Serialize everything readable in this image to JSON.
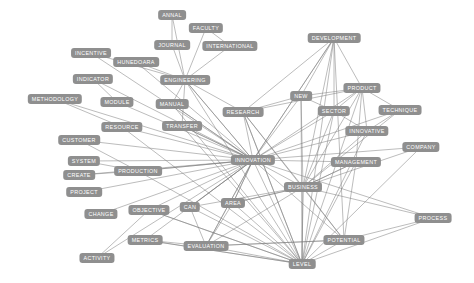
{
  "figure": {
    "type": "network-graph",
    "background_color": "#ffffff",
    "node_fill_color": "#8f8f8f",
    "node_text_color": "#ffffff",
    "edge_color": "#7a7a7a",
    "width": 474,
    "height": 283
  },
  "chart_data": {
    "type": "network",
    "title": "",
    "xlabel": "",
    "ylabel": "",
    "grid": false,
    "legend": "none",
    "node_count": 37,
    "edge_count": 121,
    "nodes": [
      {
        "id": "annal",
        "label": "ANNAL",
        "x": 172,
        "y": 15
      },
      {
        "id": "faculty",
        "label": "FACULTY",
        "x": 206,
        "y": 28
      },
      {
        "id": "journal",
        "label": "JOURNAL",
        "x": 172,
        "y": 45
      },
      {
        "id": "international",
        "label": "INTERNATIONAL",
        "x": 230,
        "y": 46
      },
      {
        "id": "development",
        "label": "DEVELOPMENT",
        "x": 334,
        "y": 38
      },
      {
        "id": "incentive",
        "label": "INCENTIVE",
        "x": 91,
        "y": 53
      },
      {
        "id": "hunedoara",
        "label": "HUNEDOARA",
        "x": 136,
        "y": 62
      },
      {
        "id": "indicator",
        "label": "INDICATOR",
        "x": 93,
        "y": 79
      },
      {
        "id": "engineering",
        "label": "ENGINEERING",
        "x": 185,
        "y": 80
      },
      {
        "id": "product",
        "label": "PRODUCT",
        "x": 362,
        "y": 88
      },
      {
        "id": "new",
        "label": "NEW",
        "x": 301,
        "y": 96
      },
      {
        "id": "methodology",
        "label": "METHODOLOGY",
        "x": 55,
        "y": 99
      },
      {
        "id": "module",
        "label": "MODULE",
        "x": 117,
        "y": 102
      },
      {
        "id": "manual",
        "label": "MANUAL",
        "x": 172,
        "y": 104
      },
      {
        "id": "research",
        "label": "RESEARCH",
        "x": 243,
        "y": 112
      },
      {
        "id": "sector",
        "label": "SECTOR",
        "x": 334,
        "y": 111
      },
      {
        "id": "technique",
        "label": "TECHNIQUE",
        "x": 400,
        "y": 110
      },
      {
        "id": "resource",
        "label": "RESOURCE",
        "x": 122,
        "y": 127
      },
      {
        "id": "transfer",
        "label": "TRANSFER",
        "x": 182,
        "y": 126
      },
      {
        "id": "innovative",
        "label": "INNOVATIVE",
        "x": 367,
        "y": 131
      },
      {
        "id": "customer",
        "label": "CUSTOMER",
        "x": 79,
        "y": 140
      },
      {
        "id": "company",
        "label": "COMPANY",
        "x": 421,
        "y": 147
      },
      {
        "id": "system",
        "label": "SYSTEM",
        "x": 84,
        "y": 161
      },
      {
        "id": "innovation",
        "label": "INNOVATION",
        "x": 253,
        "y": 160
      },
      {
        "id": "management",
        "label": "MANAGEMENT",
        "x": 356,
        "y": 162
      },
      {
        "id": "production",
        "label": "PRODUCTION",
        "x": 138,
        "y": 171
      },
      {
        "id": "create",
        "label": "CREATE",
        "x": 79,
        "y": 175
      },
      {
        "id": "business",
        "label": "BUSINESS",
        "x": 303,
        "y": 187
      },
      {
        "id": "project",
        "label": "PROJECT",
        "x": 84,
        "y": 192
      },
      {
        "id": "objective",
        "label": "OBJECTIVE",
        "x": 149,
        "y": 210
      },
      {
        "id": "can",
        "label": "CAN",
        "x": 190,
        "y": 207
      },
      {
        "id": "area",
        "label": "AREA",
        "x": 233,
        "y": 203
      },
      {
        "id": "change",
        "label": "CHANGE",
        "x": 101,
        "y": 214
      },
      {
        "id": "process",
        "label": "PROCESS",
        "x": 433,
        "y": 218
      },
      {
        "id": "metrics",
        "label": "METRICS",
        "x": 145,
        "y": 240
      },
      {
        "id": "potential",
        "label": "POTENTIAL",
        "x": 344,
        "y": 240
      },
      {
        "id": "evaluation",
        "label": "EVALUATION",
        "x": 206,
        "y": 246
      },
      {
        "id": "activity",
        "label": "ACTIVITY",
        "x": 97,
        "y": 258
      },
      {
        "id": "level",
        "label": "LEVEL",
        "x": 302,
        "y": 264
      }
    ],
    "edges": [
      [
        "annal",
        "engineering"
      ],
      [
        "faculty",
        "engineering"
      ],
      [
        "journal",
        "engineering"
      ],
      [
        "international",
        "engineering"
      ],
      [
        "faculty",
        "international"
      ],
      [
        "journal",
        "annal"
      ],
      [
        "hunedoara",
        "engineering"
      ],
      [
        "incentive",
        "innovation"
      ],
      [
        "indicator",
        "innovation"
      ],
      [
        "indicator",
        "module"
      ],
      [
        "methodology",
        "innovation"
      ],
      [
        "methodology",
        "resource"
      ],
      [
        "module",
        "innovation"
      ],
      [
        "manual",
        "innovation"
      ],
      [
        "manual",
        "engineering"
      ],
      [
        "engineering",
        "innovation"
      ],
      [
        "engineering",
        "transfer"
      ],
      [
        "engineering",
        "research"
      ],
      [
        "resource",
        "innovation"
      ],
      [
        "transfer",
        "innovation"
      ],
      [
        "customer",
        "innovation"
      ],
      [
        "system",
        "innovation"
      ],
      [
        "create",
        "innovation"
      ],
      [
        "project",
        "innovation"
      ],
      [
        "change",
        "innovation"
      ],
      [
        "production",
        "innovation"
      ],
      [
        "objective",
        "innovation"
      ],
      [
        "can",
        "innovation"
      ],
      [
        "area",
        "innovation"
      ],
      [
        "metrics",
        "innovation"
      ],
      [
        "evaluation",
        "innovation"
      ],
      [
        "activity",
        "innovation"
      ],
      [
        "activity",
        "objective"
      ],
      [
        "research",
        "innovation"
      ],
      [
        "innovation",
        "business"
      ],
      [
        "innovation",
        "level"
      ],
      [
        "innovation",
        "potential"
      ],
      [
        "innovation",
        "development"
      ],
      [
        "innovation",
        "new"
      ],
      [
        "innovation",
        "product"
      ],
      [
        "innovation",
        "sector"
      ],
      [
        "innovation",
        "management"
      ],
      [
        "innovation",
        "innovative"
      ],
      [
        "innovation",
        "technique"
      ],
      [
        "innovation",
        "process"
      ],
      [
        "innovation",
        "company"
      ],
      [
        "innovation",
        "evaluation"
      ],
      [
        "development",
        "product"
      ],
      [
        "development",
        "new"
      ],
      [
        "development",
        "sector"
      ],
      [
        "development",
        "business"
      ],
      [
        "development",
        "level"
      ],
      [
        "development",
        "innovation"
      ],
      [
        "development",
        "research"
      ],
      [
        "development",
        "potential"
      ],
      [
        "product",
        "sector"
      ],
      [
        "product",
        "technique"
      ],
      [
        "product",
        "innovative"
      ],
      [
        "product",
        "management"
      ],
      [
        "product",
        "business"
      ],
      [
        "product",
        "level"
      ],
      [
        "product",
        "new"
      ],
      [
        "new",
        "business"
      ],
      [
        "new",
        "level"
      ],
      [
        "new",
        "sector"
      ],
      [
        "sector",
        "business"
      ],
      [
        "sector",
        "level"
      ],
      [
        "sector",
        "innovative"
      ],
      [
        "technique",
        "innovative"
      ],
      [
        "technique",
        "business"
      ],
      [
        "innovative",
        "business"
      ],
      [
        "innovative",
        "level"
      ],
      [
        "company",
        "level"
      ],
      [
        "company",
        "business"
      ],
      [
        "management",
        "business"
      ],
      [
        "management",
        "level"
      ],
      [
        "management",
        "potential"
      ],
      [
        "business",
        "level"
      ],
      [
        "business",
        "potential"
      ],
      [
        "business",
        "process"
      ],
      [
        "business",
        "evaluation"
      ],
      [
        "business",
        "area"
      ],
      [
        "business",
        "can"
      ],
      [
        "potential",
        "level"
      ],
      [
        "potential",
        "process"
      ],
      [
        "potential",
        "evaluation"
      ],
      [
        "process",
        "level"
      ],
      [
        "level",
        "evaluation"
      ],
      [
        "level",
        "area"
      ],
      [
        "level",
        "can"
      ],
      [
        "level",
        "metrics"
      ],
      [
        "level",
        "objective"
      ],
      [
        "level",
        "production"
      ],
      [
        "level",
        "research"
      ],
      [
        "research",
        "business"
      ],
      [
        "research",
        "level"
      ],
      [
        "research",
        "potential"
      ],
      [
        "area",
        "evaluation"
      ],
      [
        "can",
        "evaluation"
      ],
      [
        "metrics",
        "evaluation"
      ],
      [
        "metrics",
        "level"
      ],
      [
        "evaluation",
        "potential"
      ],
      [
        "production",
        "innovation"
      ],
      [
        "objective",
        "level"
      ],
      [
        "area",
        "business"
      ],
      [
        "research",
        "new"
      ],
      [
        "research",
        "product"
      ],
      [
        "innovation",
        "area"
      ],
      [
        "innovation",
        "can"
      ],
      [
        "business",
        "management"
      ],
      [
        "level",
        "business"
      ],
      [
        "transfer",
        "level"
      ],
      [
        "manual",
        "level"
      ],
      [
        "engineering",
        "level"
      ],
      [
        "hunedoara",
        "innovation"
      ],
      [
        "incentive",
        "engineering"
      ],
      [
        "resource",
        "level"
      ],
      [
        "customer",
        "production"
      ],
      [
        "system",
        "production"
      ],
      [
        "create",
        "production"
      ],
      [
        "innovation",
        "engineering"
      ],
      [
        "innovation",
        "manual"
      ],
      [
        "innovation",
        "transfer"
      ]
    ]
  }
}
